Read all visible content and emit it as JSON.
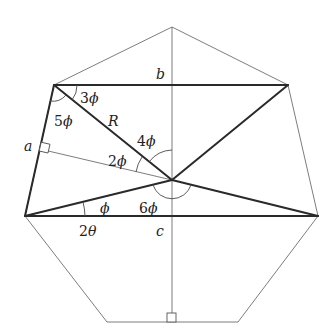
{
  "diagram": {
    "shape": "regular heptagon",
    "vertices": {
      "top": [
        172,
        27
      ],
      "upper_right": [
        288,
        85
      ],
      "lower_right": [
        318,
        216
      ],
      "bottom_right": [
        238,
        322
      ],
      "bottom_left": [
        107,
        322
      ],
      "lower_left": [
        25,
        216
      ],
      "upper_left": [
        54,
        85
      ]
    },
    "center": [
      172,
      180
    ],
    "labels": {
      "side_a": "a",
      "side_b": "b",
      "side_c": "c",
      "radius": "R",
      "angle_3phi_num": "3",
      "angle_5phi_num": "5",
      "angle_4phi_num": "4",
      "angle_2phi_num": "2",
      "angle_phi_num": "",
      "angle_6phi_num": "6",
      "angle_2theta_num": "2",
      "phi": "ϕ",
      "theta": "θ"
    },
    "angle_labels": [
      "3ϕ",
      "5ϕ",
      "4ϕ",
      "2ϕ",
      "ϕ",
      "6ϕ",
      "2θ"
    ],
    "segments": {
      "heptagon_outline": "thin",
      "vertical_axis": "thin",
      "apothem_to_a": "thin",
      "chord_b": "thick",
      "chord_c": "thick",
      "side_a": "thick",
      "diagonals_through_center": "thick"
    },
    "right_angle_markers": [
      "foot of apothem on side a",
      "foot of vertical axis on bottom side"
    ]
  }
}
